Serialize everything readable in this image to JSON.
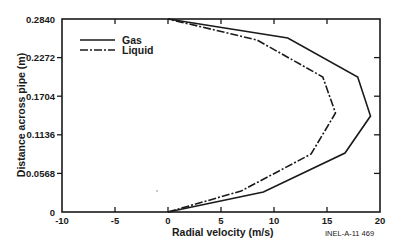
{
  "chart_data": {
    "type": "line",
    "title": "",
    "xlabel": "Radial velocity (m/s)",
    "ylabel": "Distance across pipe (m)",
    "xlim": [
      -10,
      20
    ],
    "ylim": [
      0,
      0.284
    ],
    "x_ticks": [
      "-10",
      "-5",
      "0",
      "5",
      "10",
      "15",
      "20"
    ],
    "x_tick_values": [
      -10,
      -5,
      0,
      5,
      10,
      15,
      20
    ],
    "y_ticks": [
      "0",
      "0.0568",
      "0.1136",
      "0.1704",
      "0.2272",
      "0.2840"
    ],
    "y_tick_values": [
      0,
      0.0568,
      0.1136,
      0.1704,
      0.2272,
      0.284
    ],
    "grid": false,
    "legend_position": "upper left",
    "annotation": "INEL-A-11 469",
    "series": [
      {
        "name": "Gas",
        "style": "solid",
        "points": [
          {
            "velocity": 0.0,
            "distance": 0.0
          },
          {
            "velocity": 9.0,
            "distance": 0.0294
          },
          {
            "velocity": 16.7,
            "distance": 0.0868
          },
          {
            "velocity": 19.1,
            "distance": 0.1413
          },
          {
            "velocity": 17.9,
            "distance": 0.1987
          },
          {
            "velocity": 11.3,
            "distance": 0.256
          },
          {
            "velocity": 0.0,
            "distance": 0.284
          }
        ]
      },
      {
        "name": "Liquid",
        "style": "dash-dot",
        "points": [
          {
            "velocity": 0.0,
            "distance": 0.0
          },
          {
            "velocity": 6.9,
            "distance": 0.0309
          },
          {
            "velocity": 13.5,
            "distance": 0.0853
          },
          {
            "velocity": 15.8,
            "distance": 0.1457
          },
          {
            "velocity": 14.6,
            "distance": 0.1987
          },
          {
            "velocity": 8.4,
            "distance": 0.2531
          },
          {
            "velocity": 0.0,
            "distance": 0.284
          }
        ]
      }
    ]
  },
  "legend": {
    "items": [
      {
        "label": "Gas"
      },
      {
        "label": "Liquid"
      }
    ]
  },
  "axes": {
    "x_title": "Radial velocity (m/s)",
    "y_title": "Distance across pipe (m)"
  },
  "figure_id": "INEL-A-11 469",
  "colors": {
    "ink": "#1a1a1a",
    "background": "#ffffff"
  }
}
